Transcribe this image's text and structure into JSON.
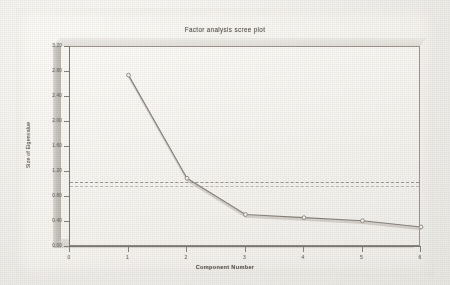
{
  "chart_data": {
    "type": "line",
    "title": "Factor analysis scree plot",
    "xlabel": "Component Number",
    "ylabel": "Size of Eigenvalue",
    "x": [
      1,
      2,
      3,
      4,
      5,
      6
    ],
    "values": [
      2.75,
      1.1,
      0.52,
      0.47,
      0.42,
      0.32
    ],
    "series": [
      {
        "name": "Eigenvalue",
        "values": [
          2.75,
          1.1,
          0.52,
          0.47,
          0.42,
          0.32
        ]
      }
    ],
    "xlim": [
      0,
      6
    ],
    "ylim": [
      0.0,
      3.2
    ],
    "x_ticks": [
      "0",
      "1",
      "2",
      "3",
      "4",
      "5",
      "6"
    ],
    "y_ticks": [
      "3.20",
      "2.80",
      "2.40",
      "2.00",
      "1.60",
      "1.20",
      "0.80",
      "0.40",
      "0.00"
    ],
    "grid": false,
    "legend": "none",
    "reference_lines": [
      {
        "label": "eigenvalue-1-criterion",
        "y": 1.04,
        "style": "dashed"
      },
      {
        "label": "eigenvalue-1-criterion-secondary",
        "y": 0.97,
        "style": "dashed"
      }
    ],
    "marker": "open-circle",
    "colors": {
      "line": "#8e8a83",
      "line_shadow": "#b6b2ab",
      "marker": "#f7f6f4",
      "marker_stroke": "#7d7971",
      "axis": "#7d7971",
      "text": "#5c5853",
      "plot_background": "#f7f5f2",
      "page_background": "#f1efec",
      "reference_line": "#8b8780"
    }
  }
}
